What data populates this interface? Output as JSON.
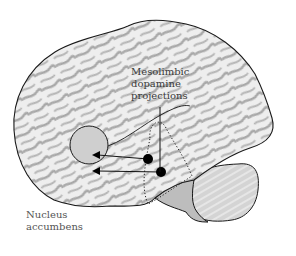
{
  "figure": {
    "top_title_partial": "",
    "labels": {
      "mesolimbic": "Mesolimbic\ndopamine\nprojections",
      "nucleus_accumbens": "Nucleus\naccumbens"
    },
    "colors": {
      "brain_fill": "#e9e9e9",
      "sulci": "#a8a8a8",
      "outline": "#1a1a1a",
      "cerebellum_fill": "#c9c9c9",
      "nacc_fill": "#cfcfcf",
      "dots": "#000000"
    }
  }
}
